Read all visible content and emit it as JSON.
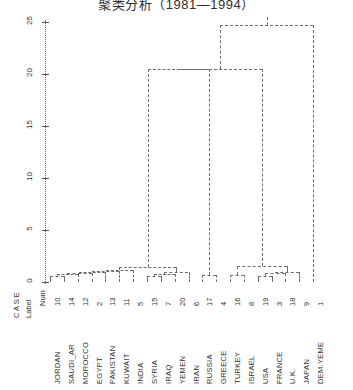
{
  "title": "聚类分析（1981—1994）",
  "chart_data": {
    "type": "dendrogram",
    "title": "聚类分析（1981—1994）",
    "xlabel": "",
    "ylabel": "Rescaled Distance Cluster Combine",
    "ylim": [
      0,
      25
    ],
    "yticks": [
      0,
      5,
      10,
      15,
      20,
      25
    ],
    "ytick_labels": [
      "0",
      "5",
      "10",
      "15",
      "20",
      "25"
    ],
    "grid": false,
    "legend": null,
    "axis_style": "dotted",
    "link_style": "dashed",
    "column_headers": {
      "case": "C A S E",
      "label": "Label",
      "num": "Num"
    },
    "leaves": [
      {
        "label": "JORDAN",
        "num": 10
      },
      {
        "label": "SAUDI_AR",
        "num": 14
      },
      {
        "label": "MOROCCO",
        "num": 12
      },
      {
        "label": "EGYPT",
        "num": 2
      },
      {
        "label": "PAKISTAN",
        "num": 13
      },
      {
        "label": "KUWAIT",
        "num": 11
      },
      {
        "label": "INDIA",
        "num": 5
      },
      {
        "label": "SYRIA",
        "num": 15
      },
      {
        "label": "IRAQ",
        "num": 7
      },
      {
        "label": "YEMEN",
        "num": 20
      },
      {
        "label": "IRAN",
        "num": 6
      },
      {
        "label": "RUSSIA",
        "num": 17
      },
      {
        "label": "GREECE",
        "num": 4
      },
      {
        "label": "TURKEY",
        "num": 16
      },
      {
        "label": "ISRAEL",
        "num": 8
      },
      {
        "label": "USA",
        "num": 19
      },
      {
        "label": "FRANCE",
        "num": 3
      },
      {
        "label": "U.K.",
        "num": 18
      },
      {
        "label": "JAPAN",
        "num": 9
      },
      {
        "label": "DEM.YEME",
        "num": 1
      }
    ],
    "merges": [
      {
        "id": "m1",
        "left": "leaf0",
        "right": "leaf1",
        "height": 0.6
      },
      {
        "id": "m2",
        "left": "m1",
        "right": "leaf2",
        "height": 0.8
      },
      {
        "id": "m3",
        "left": "m2",
        "right": "leaf3",
        "height": 0.9
      },
      {
        "id": "m4",
        "left": "m3",
        "right": "leaf4",
        "height": 1.0
      },
      {
        "id": "m5",
        "left": "m4",
        "right": "leaf5",
        "height": 1.1
      },
      {
        "id": "m6",
        "left": "m5",
        "right": "leaf6",
        "height": 1.2
      },
      {
        "id": "m7",
        "left": "leaf7",
        "right": "leaf8",
        "height": 0.6
      },
      {
        "id": "m8",
        "left": "m7",
        "right": "leaf9",
        "height": 0.8
      },
      {
        "id": "m9",
        "left": "m8",
        "right": "leaf10",
        "height": 1.0
      },
      {
        "id": "m10",
        "left": "m6",
        "right": "m9",
        "height": 1.4
      },
      {
        "id": "m11",
        "left": "leaf11",
        "right": "leaf12",
        "height": 0.7
      },
      {
        "id": "m12",
        "left": "leaf13",
        "right": "leaf14",
        "height": 0.7
      },
      {
        "id": "m13",
        "left": "leaf15",
        "right": "leaf16",
        "height": 0.6
      },
      {
        "id": "m14",
        "left": "m13",
        "right": "leaf17",
        "height": 0.9
      },
      {
        "id": "m15",
        "left": "m14",
        "right": "leaf18",
        "height": 1.0
      },
      {
        "id": "m16",
        "left": "m12",
        "right": "m15",
        "height": 1.5
      },
      {
        "id": "m17",
        "left": "m10",
        "right": "m11",
        "height": 20.5
      },
      {
        "id": "m18",
        "left": "m17",
        "right": "m16",
        "height": 20.5
      },
      {
        "id": "m19",
        "left": "m18",
        "right": "leaf19",
        "height": 24.7
      }
    ]
  }
}
